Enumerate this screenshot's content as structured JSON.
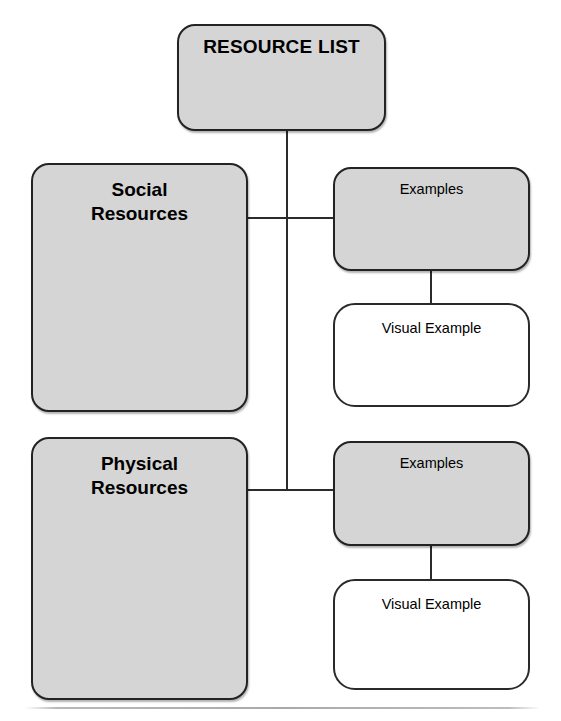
{
  "diagram": {
    "root": {
      "label": "RESOURCE LIST"
    },
    "branches": [
      {
        "label": "Social\nResources",
        "examples_label": "Examples",
        "visual_label": "Visual Example"
      },
      {
        "label": "Physical\nResources",
        "examples_label": "Examples",
        "visual_label": "Visual Example"
      }
    ],
    "colors": {
      "node_fill": "#d5d5d5",
      "node_stroke": "#232323",
      "hollow_fill": "#ffffff",
      "connector": "#2b2b2b",
      "footer_rule": "#a9a9a9",
      "page_background": "#ffffff",
      "text": "#000000"
    }
  }
}
